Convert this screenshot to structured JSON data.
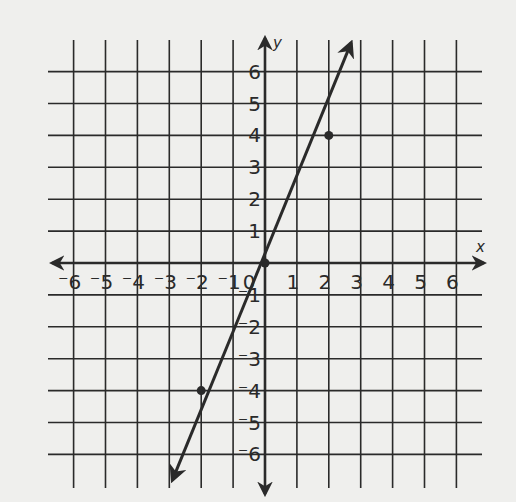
{
  "chart_data": {
    "type": "line",
    "title": "",
    "xlabel": "x",
    "ylabel": "y",
    "xlim": [
      -6,
      6
    ],
    "ylim": [
      -6,
      6
    ],
    "grid": true,
    "x_ticks": [
      -6,
      -5,
      -4,
      -3,
      -2,
      -1,
      0,
      1,
      2,
      3,
      4,
      5,
      6
    ],
    "y_ticks": [
      -6,
      -5,
      -4,
      -3,
      -2,
      -1,
      1,
      2,
      3,
      4,
      5,
      6
    ],
    "x_tick_labels": [
      "-6",
      "-5",
      "-4",
      "-3",
      "-2",
      "-1",
      "0",
      "1",
      "2",
      "3",
      "4",
      "5",
      "6"
    ],
    "y_tick_labels": [
      "6",
      "5",
      "4",
      "3",
      "2",
      "1",
      "-1",
      "-2",
      "-3",
      "-4",
      "-5",
      "-6"
    ],
    "series": [
      {
        "name": "y = 2x",
        "slope": 2,
        "intercept": 0,
        "arrows_both_ends": true,
        "line_extent": {
          "start": [
            -2.9,
            -6.8
          ],
          "end": [
            2.7,
            6.9
          ]
        },
        "marked_points": [
          {
            "x": -2,
            "y": -4
          },
          {
            "x": 0,
            "y": 0
          },
          {
            "x": 2,
            "y": 4
          }
        ]
      }
    ],
    "colors": {
      "background": "#efefed",
      "ink": "#2a2a2a"
    }
  }
}
